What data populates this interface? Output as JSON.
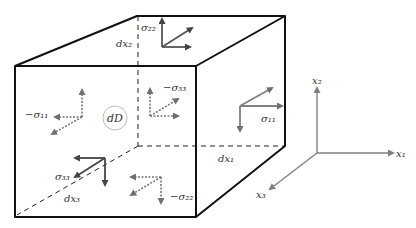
{
  "diagram": {
    "element_label": "dD",
    "edge_labels": {
      "dx1": "dx₁",
      "dx2": "dx₂",
      "dx3": "dx₃"
    },
    "stress_labels": {
      "s11": "σ₁₁",
      "neg_s11": "−σ₁₁",
      "s22": "σ₂₂",
      "neg_s22": "−σ₂₂",
      "s33": "σ₃₃",
      "neg_s33": "−σ₃₃"
    },
    "axes": {
      "x1": "x₁",
      "x2": "x₂",
      "x3": "x₃"
    },
    "colors": {
      "edge": "#111111",
      "arrow": "#707070",
      "dark_arrow": "#444444",
      "axis": "#808080",
      "circle": "#aaaaaa"
    }
  }
}
